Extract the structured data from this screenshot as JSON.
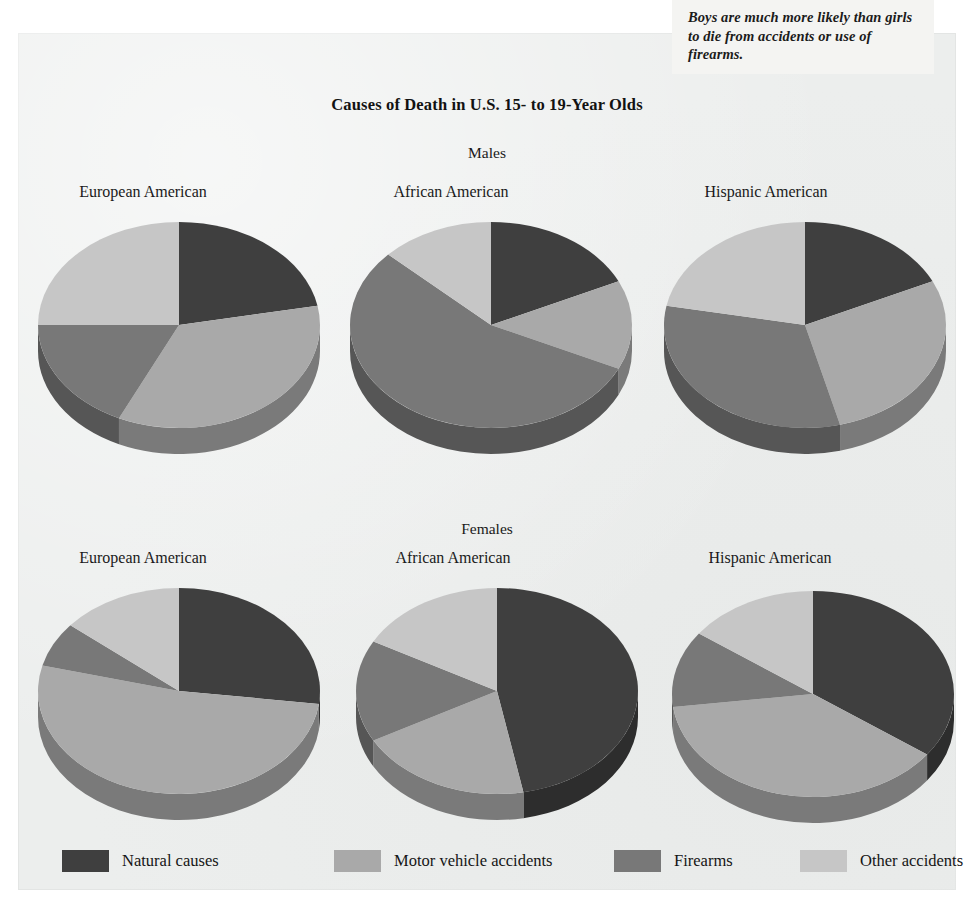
{
  "annotation": {
    "text": "Boys are much more likely than girls to die from accidents or use of firearms."
  },
  "title": "Causes of Death in U.S. 15- to 19-Year Olds",
  "groups": [
    {
      "label": "Males"
    },
    {
      "label": "Females"
    }
  ],
  "pie_labels": {
    "european": "European American",
    "african": "African American",
    "hispanic": "Hispanic American"
  },
  "legend": {
    "items": [
      {
        "label": "Natural causes",
        "color": "#3f3f3f",
        "icon": "legend-swatch"
      },
      {
        "label": "Motor vehicle accidents",
        "color": "#a9a9a9",
        "icon": "legend-swatch"
      },
      {
        "label": "Firearms",
        "color": "#787878",
        "icon": "legend-swatch"
      },
      {
        "label": "Other accidents",
        "color": "#c6c6c6",
        "icon": "legend-swatch"
      }
    ]
  },
  "chart_data": {
    "type": "pie",
    "title": "Causes of Death in U.S. 15- to 19-Year Olds",
    "annotation": "Boys are much more likely than girls to die from accidents or use of firearms.",
    "units": "percent of deaths",
    "categories": [
      "Natural causes",
      "Motor vehicle accidents",
      "Firearms",
      "Other accidents"
    ],
    "colors": [
      "#3f3f3f",
      "#a9a9a9",
      "#787878",
      "#c6c6c6"
    ],
    "legend_position": "bottom",
    "start_angle_deg": 0,
    "direction": "clockwise",
    "panels": [
      {
        "group": "Males",
        "ethnicity": "European American",
        "values": [
          22,
          35,
          18,
          25
        ]
      },
      {
        "group": "Males",
        "ethnicity": "African American",
        "values": [
          18,
          14,
          55,
          13
        ]
      },
      {
        "group": "Males",
        "ethnicity": "Hispanic American",
        "values": [
          18,
          28,
          32,
          22
        ]
      },
      {
        "group": "Females",
        "ethnicity": "European American",
        "values": [
          27,
          52,
          7,
          14
        ]
      },
      {
        "group": "Females",
        "ethnicity": "African American",
        "values": [
          47,
          20,
          16,
          17
        ]
      },
      {
        "group": "Females",
        "ethnicity": "Hispanic American",
        "values": [
          35,
          38,
          12,
          15
        ]
      }
    ]
  },
  "pie_geometry": {
    "rx": 141,
    "ry": 103,
    "depth": 26
  }
}
